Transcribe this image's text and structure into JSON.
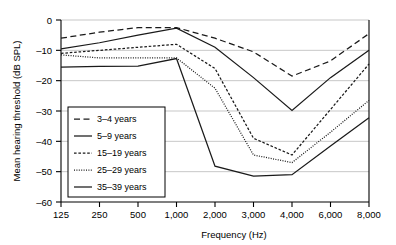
{
  "chart_data": {
    "type": "line",
    "title": "",
    "xlabel": "Frequency (Hz)",
    "ylabel": "Mean hearing threshold (dB SPL)",
    "categories": [
      "125",
      "250",
      "500",
      "1,000",
      "2,000",
      "3,000",
      "4,000",
      "6,000",
      "8,000"
    ],
    "ylim": [
      -60,
      0
    ],
    "yticks": [
      0,
      -10,
      -20,
      -30,
      -40,
      -50,
      -60
    ],
    "ytick_labels": [
      "0",
      "–10",
      "–20",
      "–30",
      "–40",
      "–50",
      "–60"
    ],
    "grid": true,
    "legend_position": "lower-left-inside",
    "series": [
      {
        "name": "3–4 years",
        "style": "dashed-long",
        "values": [
          -6.0,
          -4.0,
          -2.5,
          -2.5,
          -6.0,
          -10.5,
          -18.5,
          -13.5,
          -4.5
        ]
      },
      {
        "name": "5–9 years",
        "style": "solid",
        "values": [
          -9.5,
          -7.5,
          -5.0,
          -2.7,
          -9.0,
          -19.0,
          -29.8,
          -19.0,
          -10.0
        ]
      },
      {
        "name": "15–19 years",
        "style": "dashed-short",
        "values": [
          -11.0,
          -10.0,
          -9.0,
          -8.0,
          -16.0,
          -39.0,
          -44.5,
          -29.5,
          -14.5
        ]
      },
      {
        "name": "25–29 years",
        "style": "dotted",
        "values": [
          -11.5,
          -12.5,
          -12.5,
          -12.5,
          -22.5,
          -44.5,
          -47.0,
          -37.0,
          -26.5
        ]
      },
      {
        "name": "35–39 years",
        "style": "solid",
        "values": [
          -15.5,
          -15.3,
          -15.2,
          -12.7,
          -48.2,
          -51.5,
          -51.0,
          -41.5,
          -32.2
        ]
      }
    ]
  },
  "axes": {
    "x_title": "Frequency (Hz)",
    "y_title": "Mean hearing threshold (dB SPL)"
  },
  "legend": {
    "entries": [
      {
        "label": "3–4 years"
      },
      {
        "label": "5–9 years"
      },
      {
        "label": "15–19 years"
      },
      {
        "label": "25–29 years"
      },
      {
        "label": "35–39 years"
      }
    ]
  }
}
